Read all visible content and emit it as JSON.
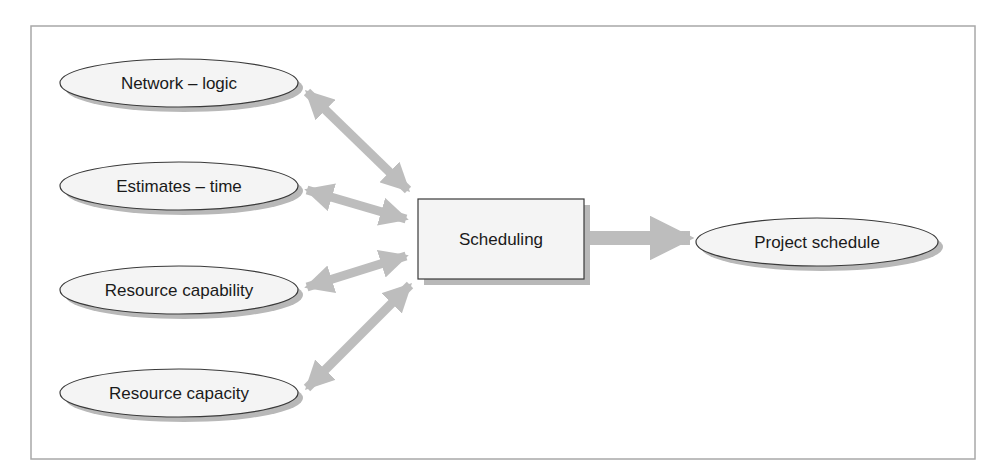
{
  "diagram": {
    "title": "",
    "colors": {
      "frame": "#a8a8a8",
      "node_fill": "#f4f4f4",
      "node_stroke": "#3a3a3a",
      "shadow": "#b8b8b8",
      "arrow": "#bdbdbd",
      "text": "#1a1a1a"
    },
    "inputs": [
      {
        "id": "network-logic",
        "label": "Network – logic"
      },
      {
        "id": "estimates-time",
        "label": "Estimates – time"
      },
      {
        "id": "resource-capability",
        "label": "Resource capability"
      },
      {
        "id": "resource-capacity",
        "label": "Resource capacity"
      }
    ],
    "process": {
      "id": "scheduling",
      "label": "Scheduling"
    },
    "output": {
      "id": "project-schedule",
      "label": "Project schedule"
    },
    "edges": [
      {
        "from": "network-logic",
        "to": "scheduling",
        "type": "bidirectional"
      },
      {
        "from": "estimates-time",
        "to": "scheduling",
        "type": "bidirectional"
      },
      {
        "from": "resource-capability",
        "to": "scheduling",
        "type": "bidirectional"
      },
      {
        "from": "resource-capacity",
        "to": "scheduling",
        "type": "bidirectional"
      },
      {
        "from": "scheduling",
        "to": "project-schedule",
        "type": "directed"
      }
    ]
  }
}
